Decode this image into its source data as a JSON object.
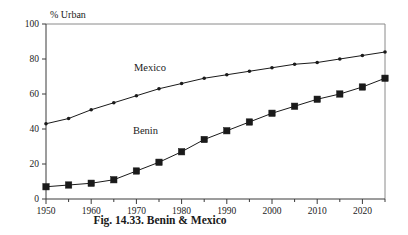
{
  "chart_data": {
    "type": "line",
    "title": "",
    "caption": "Fig. 14.33. Benin & Mexico",
    "ylabel": "% Urban",
    "xlabel": "",
    "xlim": [
      1950,
      2025
    ],
    "ylim": [
      0,
      100
    ],
    "grid": false,
    "legend": "inline-labels",
    "x_ticks_major": [
      1950,
      1960,
      1970,
      1980,
      1990,
      2000,
      2010,
      2020
    ],
    "x_ticks_minor": [
      1955,
      1965,
      1975,
      1985,
      1995,
      2005,
      2015,
      2025
    ],
    "y_ticks": [
      0,
      20,
      40,
      60,
      80,
      100
    ],
    "x": [
      1950,
      1955,
      1960,
      1965,
      1970,
      1975,
      1980,
      1985,
      1990,
      1995,
      2000,
      2005,
      2010,
      2015,
      2020,
      2025
    ],
    "series": [
      {
        "name": "Mexico",
        "marker": "small-dot",
        "color": "#1a1a1a",
        "label_x": 1973,
        "label_y": 73,
        "values": [
          43,
          46,
          51,
          55,
          59,
          63,
          66,
          69,
          71,
          73,
          75,
          77,
          78,
          80,
          82,
          84
        ]
      },
      {
        "name": "Benin",
        "marker": "large-square",
        "color": "#1a1a1a",
        "label_x": 1972,
        "label_y": 37,
        "values": [
          7,
          8,
          9,
          11,
          16,
          21,
          27,
          34,
          39,
          44,
          49,
          53,
          57,
          60,
          64,
          69
        ]
      }
    ]
  },
  "labels": {
    "y_axis_title": "% Urban",
    "caption": "Fig. 14.33. Benin & Mexico",
    "y_ticks": [
      "0",
      "20",
      "40",
      "60",
      "80",
      "100"
    ],
    "x_ticks": [
      "1950",
      "1960",
      "1970",
      "1980",
      "1990",
      "2000",
      "2010",
      "2020"
    ],
    "series_mexico": "Mexico",
    "series_benin": "Benin"
  }
}
